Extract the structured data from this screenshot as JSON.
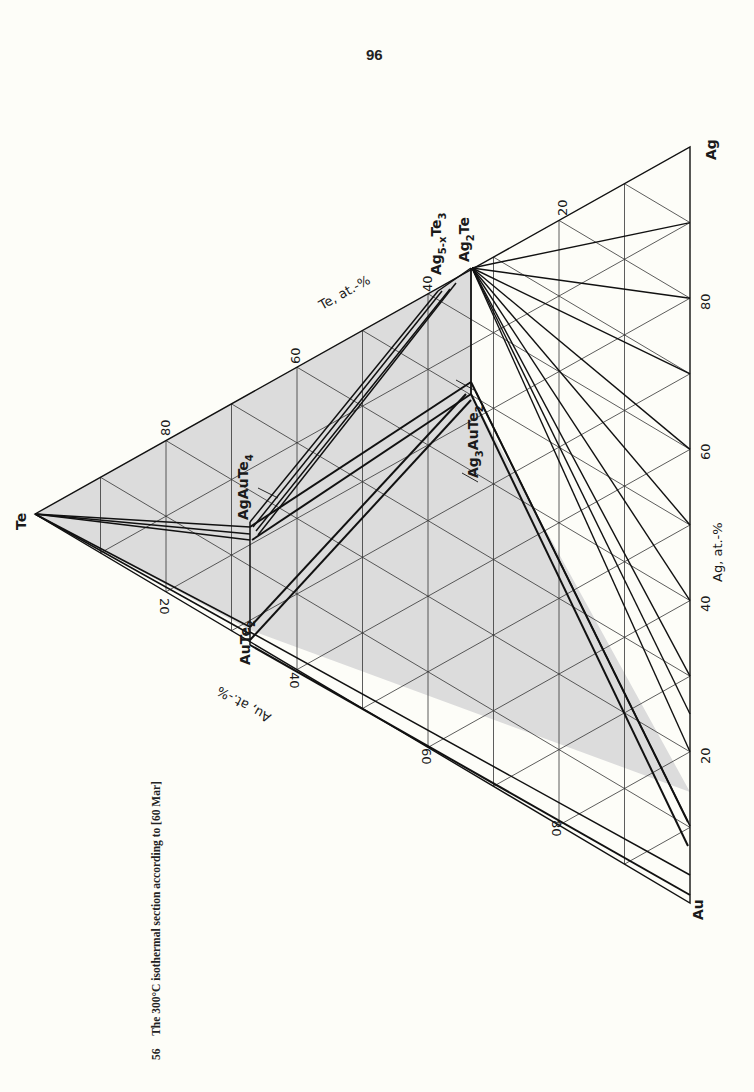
{
  "page": {
    "number": "96"
  },
  "caption": {
    "figure_number": "56",
    "text": "The 300°C isothermal section according to [60 Mar]"
  },
  "diagram": {
    "type": "ternary-phase-diagram",
    "system": "Ag-Au-Te",
    "vertices": {
      "te": "Te",
      "ag": "Ag",
      "au": "Au"
    },
    "axes": {
      "te": {
        "label": "Te, at.-%",
        "ticks": [
          "20",
          "40",
          "60",
          "80"
        ]
      },
      "ag": {
        "label": "Ag, at.-%",
        "ticks": [
          "20",
          "40",
          "60",
          "80"
        ]
      },
      "au": {
        "label": "Au, at.-%",
        "ticks": [
          "20",
          "40",
          "60",
          "80"
        ]
      }
    },
    "phases": {
      "aute2": "AuTe",
      "aute2_sub": "2",
      "agaute4": "AgAuTe",
      "agaute4_sub": "4",
      "ag2te": "Ag",
      "ag2te_sub": "2",
      "ag2te_tail": "Te",
      "ag5te3": "Ag",
      "ag5te3_sub": "5-x",
      "ag5te3_tail": "Te",
      "ag5te3_sub2": "3",
      "ag3aute2": "Ag",
      "ag3aute2_sub": "3",
      "ag3aute2_mid": "AuTe",
      "ag3aute2_sub2": "2"
    },
    "colors": {
      "shade": "#d9d9d9",
      "line": "#1a1a1a",
      "grid": "#333333"
    }
  }
}
